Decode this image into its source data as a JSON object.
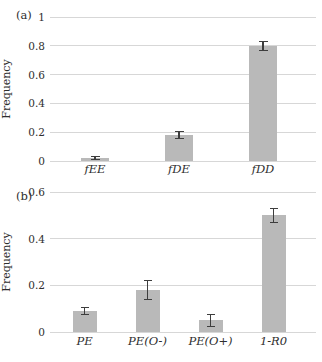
{
  "figure": {
    "background": "#ffffff"
  },
  "colors": {
    "bar_fill": "#b9b9b9",
    "gridline": "#d7d7d7",
    "error_bar": "#3d3d3d",
    "text": "#2e2e2e"
  },
  "chart_data": [
    {
      "type": "bar",
      "panel_label": "(a)",
      "title": "",
      "xlabel": "",
      "ylabel": "Frequency",
      "categories": [
        "fEE",
        "fDE",
        "fDD"
      ],
      "values": [
        0.02,
        0.18,
        0.8
      ],
      "errors": [
        0.01,
        0.025,
        0.03
      ],
      "ylim": [
        0,
        1
      ],
      "yticks": [
        0,
        0.2,
        0.4,
        0.6,
        0.8,
        1
      ],
      "ytick_labels": [
        "0",
        "0.2",
        "0.4",
        "0.6",
        "0.8",
        "1"
      ],
      "grid": true,
      "legend": false
    },
    {
      "type": "bar",
      "panel_label": "(b)",
      "title": "",
      "xlabel": "",
      "ylabel": "Frequency",
      "categories": [
        "PE",
        "PE(O-)",
        "PE(O+)",
        "1-R0"
      ],
      "values": [
        0.09,
        0.18,
        0.05,
        0.5
      ],
      "errors": [
        0.015,
        0.04,
        0.025,
        0.03
      ],
      "ylim": [
        0,
        0.6
      ],
      "yticks": [
        0,
        0.2,
        0.4,
        0.6
      ],
      "ytick_labels": [
        "0",
        "0.2",
        "0.4",
        "0.6"
      ],
      "grid": true,
      "legend": false
    }
  ]
}
